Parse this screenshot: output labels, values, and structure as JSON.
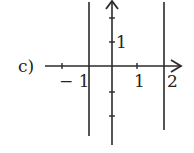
{
  "diagram": {
    "label": "c)",
    "x_ticks": [
      "− 1",
      "1",
      "2"
    ],
    "y_ticks": [
      "1"
    ],
    "vertical_lines": [
      "x = -1/2",
      "x = 2"
    ],
    "stroke_color": "#2a2a2a"
  }
}
